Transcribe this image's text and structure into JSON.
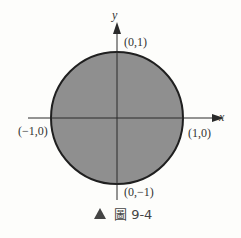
{
  "figure": {
    "caption_marker": "▲",
    "caption": "圖 9-4",
    "axes": {
      "x_label": "x",
      "y_label": "y"
    },
    "points": {
      "top": "(0,1)",
      "bottom": "(0,−1)",
      "left": "(−1,0)",
      "right": "(1,0)"
    },
    "colors": {
      "fill": "#8f8f8f",
      "stroke": "#1f1f1f",
      "axis": "#2a2a2a"
    }
  }
}
